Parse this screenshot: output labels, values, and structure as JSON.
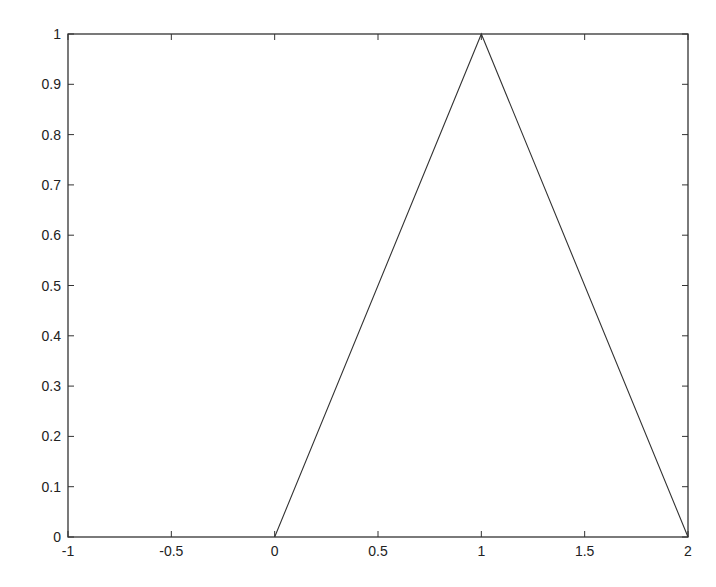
{
  "chart_data": {
    "type": "line",
    "title": "",
    "xlabel": "",
    "ylabel": "",
    "xlim": [
      -1,
      2
    ],
    "ylim": [
      0,
      1
    ],
    "grid": false,
    "legend": null,
    "x_ticks": [
      "-1",
      "-0.5",
      "0",
      "0.5",
      "1",
      "1.5",
      "2"
    ],
    "y_ticks": [
      "0",
      "0.1",
      "0.2",
      "0.3",
      "0.4",
      "0.5",
      "0.6",
      "0.7",
      "0.8",
      "0.9",
      "1"
    ],
    "series": [
      {
        "name": "triangle",
        "color": "#333333",
        "x": [
          0,
          1,
          2
        ],
        "y": [
          0,
          1,
          0
        ]
      }
    ]
  },
  "colors": {
    "axis": "#333333",
    "line": "#333333",
    "background": "#ffffff"
  }
}
